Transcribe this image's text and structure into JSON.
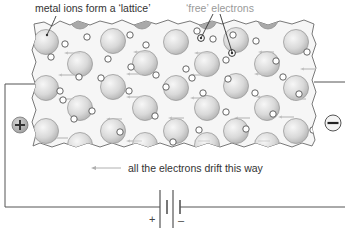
{
  "labels": {
    "lattice": "metal ions form a ‘lattice’",
    "free_electrons": "‘free’ electrons",
    "drift": "all the electrons drift this way"
  },
  "terminals": {
    "positive_symbol": "+",
    "negative_symbol": "−"
  },
  "battery": {
    "positive_sign": "+",
    "negative_sign": "–"
  },
  "colors": {
    "ion_fill_light": "#f2f2f2",
    "ion_fill_dark": "#bdbdbd",
    "ion_stroke": "#9a9a9a",
    "electron_stroke": "#555555",
    "arrow": "#b8b8b8",
    "wire": "#555555",
    "label_dark": "#333333",
    "label_grey": "#9a9a9a",
    "terminal_fill": "#bdbdbd"
  },
  "diagram": {
    "ions": [
      [
        46,
        42
      ],
      [
        113,
        41
      ],
      [
        176,
        42
      ],
      [
        236,
        40
      ],
      [
        296,
        42
      ],
      [
        80,
        64
      ],
      [
        145,
        63
      ],
      [
        207,
        64
      ],
      [
        267,
        64
      ],
      [
        46,
        88
      ],
      [
        113,
        87
      ],
      [
        176,
        88
      ],
      [
        236,
        86
      ],
      [
        296,
        88
      ],
      [
        80,
        108
      ],
      [
        145,
        108
      ],
      [
        207,
        108
      ],
      [
        267,
        108
      ],
      [
        46,
        131
      ],
      [
        113,
        131
      ],
      [
        176,
        131
      ],
      [
        236,
        131
      ],
      [
        296,
        131
      ]
    ],
    "bottom_half_ions": [
      [
        80,
        145
      ],
      [
        145,
        145
      ],
      [
        207,
        145
      ],
      [
        267,
        145
      ]
    ],
    "top_half_ions": [
      [
        80,
        23
      ],
      [
        142,
        23
      ],
      [
        207,
        23
      ],
      [
        268,
        23
      ]
    ],
    "electrons": [
      [
        65,
        44
      ],
      [
        87,
        37
      ],
      [
        130,
        35
      ],
      [
        146,
        45
      ],
      [
        197,
        31
      ],
      [
        213,
        39
      ],
      [
        233,
        35
      ],
      [
        256,
        41
      ],
      [
        307,
        52
      ],
      [
        51,
        57
      ],
      [
        108,
        59
      ],
      [
        131,
        67
      ],
      [
        186,
        69
      ],
      [
        226,
        60
      ],
      [
        276,
        61
      ],
      [
        79,
        77
      ],
      [
        101,
        78
      ],
      [
        156,
        75
      ],
      [
        192,
        78
      ],
      [
        228,
        79
      ],
      [
        283,
        77
      ],
      [
        60,
        91
      ],
      [
        63,
        100
      ],
      [
        129,
        91
      ],
      [
        166,
        87
      ],
      [
        203,
        93
      ],
      [
        255,
        93
      ],
      [
        299,
        94
      ],
      [
        92,
        111
      ],
      [
        155,
        116
      ],
      [
        226,
        112
      ],
      [
        273,
        114
      ],
      [
        74,
        119
      ],
      [
        120,
        132
      ],
      [
        199,
        130
      ],
      [
        246,
        129
      ],
      [
        313,
        130
      ],
      [
        173,
        142
      ]
    ],
    "drift_arrows": [
      [
        66,
        53
      ],
      [
        135,
        52
      ],
      [
        196,
        53
      ],
      [
        260,
        52
      ],
      [
        302,
        69
      ],
      [
        60,
        75
      ],
      [
        128,
        74
      ],
      [
        192,
        75
      ],
      [
        256,
        74
      ],
      [
        60,
        99
      ],
      [
        128,
        97
      ],
      [
        192,
        98
      ],
      [
        258,
        97
      ],
      [
        292,
        99
      ],
      [
        108,
        119
      ],
      [
        170,
        118
      ],
      [
        236,
        118
      ],
      [
        280,
        117
      ],
      [
        54,
        138
      ],
      [
        128,
        141
      ],
      [
        196,
        141
      ],
      [
        256,
        141
      ]
    ]
  }
}
